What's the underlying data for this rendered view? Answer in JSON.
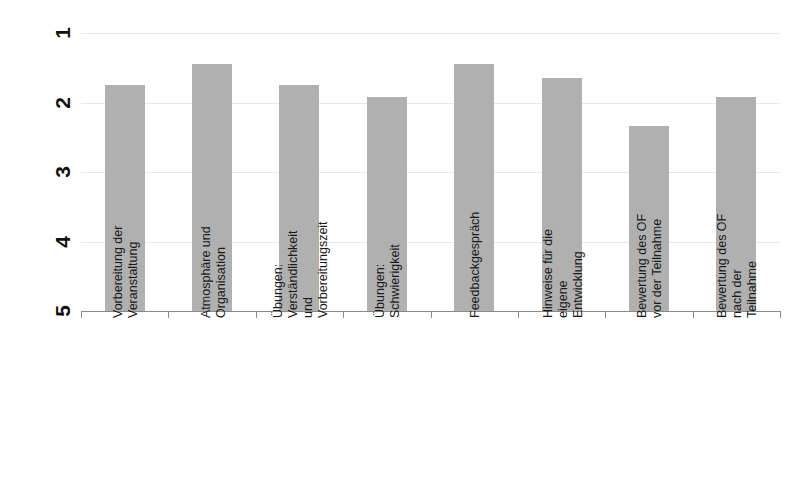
{
  "chart_data": {
    "type": "bar",
    "title": "",
    "xlabel": "",
    "ylabel": "",
    "ylim": [
      5,
      1
    ],
    "y_inverted": true,
    "grid": true,
    "legend": "none",
    "orientation": "rotated-90-ccw",
    "tick_labels": [
      "1",
      "2",
      "3",
      "4",
      "5"
    ],
    "tick_values": [
      1,
      2,
      3,
      4,
      5
    ],
    "bar_color": "#b0b0b0",
    "categories": [
      "Vorbereitung der Veranstaltung",
      "Atmosphäre und Organisation",
      "Übungen: Verständlichkeit und Vorbereitungszeit",
      "Übungen: Schwierigkeit",
      "Feedbackgespräch",
      "Hinweise für die eigene Entwicklung",
      "Bewertung des OF vor der Teilnahme",
      "Bewertung des OF nach der Teilnahme"
    ],
    "category_lines": [
      [
        "Vorbereitung der",
        "Veranstaltung"
      ],
      [
        "Atmosphäre und",
        "Organisation"
      ],
      [
        "Übungen:",
        "Verständlichkeit",
        "und",
        "Vorbereitungszeit"
      ],
      [
        "Übungen:",
        "Schwierigkeit"
      ],
      [
        "Feedbackgespräch"
      ],
      [
        "Hinweise für die",
        "eigene",
        "Entwicklung"
      ],
      [
        "Bewertung des OF",
        "vor der Teilnahme"
      ],
      [
        "Bewertung des OF",
        "nach der",
        "Teilnahme"
      ]
    ],
    "values": [
      1.75,
      1.45,
      1.75,
      1.92,
      1.45,
      1.65,
      2.34,
      1.92
    ]
  }
}
